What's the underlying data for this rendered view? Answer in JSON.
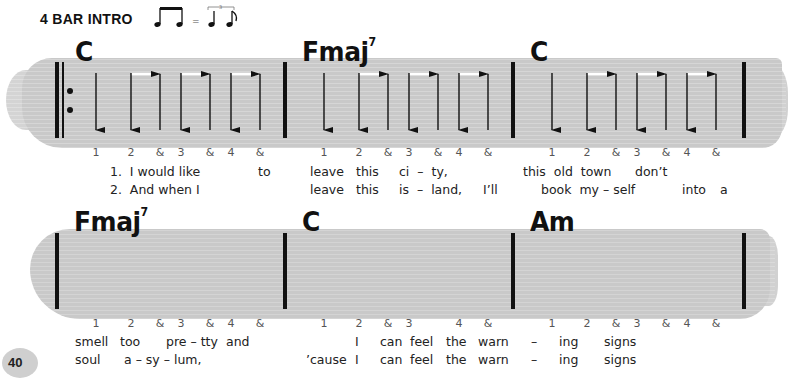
{
  "header": {
    "title": "4 BAR INTRO",
    "swing_equals": "=",
    "triplet_number": "3"
  },
  "page_number": "40",
  "rows": [
    {
      "bars": [
        {
          "chord": "C",
          "chord_sup": "",
          "counts": [
            "1",
            "2",
            "&",
            "3",
            "&",
            "4",
            "&"
          ],
          "strums": [
            "down",
            "down",
            "up",
            "down",
            "up",
            "down",
            "up"
          ]
        },
        {
          "chord": "Fmaj",
          "chord_sup": "7",
          "counts": [
            "1",
            "2",
            "&",
            "3",
            "&",
            "4",
            "&"
          ],
          "strums": [
            "down",
            "down",
            "up",
            "down",
            "up",
            "down",
            "up"
          ]
        },
        {
          "chord": "C",
          "chord_sup": "",
          "counts": [
            "1",
            "2",
            "&",
            "3",
            "&",
            "4",
            "&"
          ],
          "strums": [
            "down",
            "down",
            "up",
            "down",
            "up",
            "down",
            "up"
          ]
        }
      ],
      "lyrics": [
        [
          "1.  I would like",
          "to",
          "leave",
          "this",
          "ci  –  ty,",
          "this  old  town",
          "don’t"
        ],
        [
          "2.  And when I",
          "leave",
          "this",
          "is  –  land,",
          "I’ll",
          "book  my – self",
          "into",
          "a"
        ]
      ]
    },
    {
      "bars": [
        {
          "chord": "Fmaj",
          "chord_sup": "7",
          "counts": [
            "1",
            "2",
            "&",
            "3",
            "&",
            "4",
            "&"
          ],
          "strums": [
            "down",
            "down",
            "up",
            "down",
            "up",
            "down",
            "up"
          ]
        },
        {
          "chord": "C",
          "chord_sup": "",
          "counts": [
            "1",
            "2",
            "&",
            "3",
            "4",
            "&"
          ],
          "strums": [
            "down",
            "down",
            "up",
            "down",
            "down",
            "up"
          ]
        },
        {
          "chord": "Am",
          "chord_sup": "",
          "counts": [
            "1",
            "2",
            "&",
            "3",
            "&",
            "4",
            "&"
          ],
          "strums": [
            "down",
            "down",
            "up",
            "down",
            "up",
            "down",
            "up"
          ]
        }
      ],
      "lyrics": [
        [
          "smell",
          "too",
          "pre – tty",
          "and",
          "I",
          "can",
          "feel",
          "the",
          "warn",
          "–",
          "ing",
          "signs"
        ],
        [
          "soul",
          "a – sy – lum,",
          "’cause",
          "I",
          "can",
          "feel",
          "the",
          "warn",
          "–",
          "ing",
          "signs"
        ]
      ]
    }
  ],
  "colors": {
    "brush": "#c9c9c9",
    "ink": "#111111",
    "count_text": "#555555"
  }
}
